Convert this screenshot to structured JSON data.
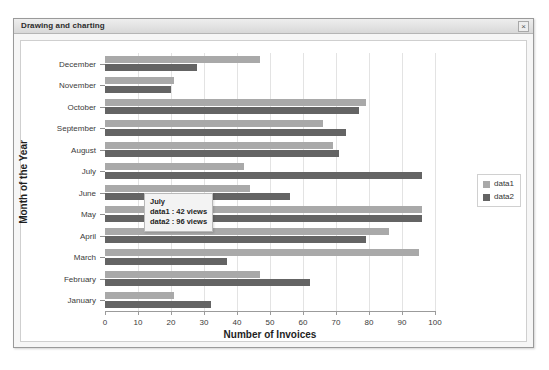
{
  "window": {
    "title": "Drawing and charting",
    "close_label": "×"
  },
  "legend": {
    "items": [
      {
        "label": "data1",
        "color": "#a9a9a9"
      },
      {
        "label": "data2",
        "color": "#646464"
      }
    ]
  },
  "tooltip": {
    "title": "July",
    "line1": "data1 : 42 views",
    "line2": "data2 : 96 views"
  },
  "chart_data": {
    "type": "bar",
    "orientation": "horizontal",
    "title": "",
    "xlabel": "Number of Invoices",
    "ylabel": "Month of the Year",
    "xlim": [
      0,
      100
    ],
    "xticks": [
      0,
      10,
      20,
      30,
      40,
      50,
      60,
      70,
      80,
      90,
      100
    ],
    "grid": true,
    "legend_position": "right",
    "categories": [
      "December",
      "November",
      "October",
      "September",
      "August",
      "July",
      "June",
      "May",
      "April",
      "March",
      "February",
      "January"
    ],
    "series": [
      {
        "name": "data1",
        "color": "#a9a9a9",
        "values": [
          47,
          21,
          79,
          66,
          69,
          42,
          44,
          96,
          86,
          95,
          47,
          21
        ]
      },
      {
        "name": "data2",
        "color": "#646464",
        "values": [
          28,
          20,
          77,
          73,
          71,
          96,
          56,
          96,
          79,
          37,
          62,
          32
        ]
      }
    ]
  }
}
